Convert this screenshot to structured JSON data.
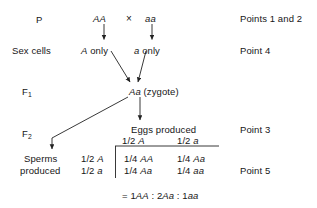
{
  "figure": {
    "type": "genetics-monohybrid-cross",
    "stroke_color": "#222222",
    "text_color": "#161616",
    "background": "#ffffff"
  },
  "rows": {
    "p": {
      "label": "P",
      "parent_left": "AA",
      "cross_symbol": "×",
      "parent_right": "aa",
      "point": "Points 1 and 2"
    },
    "sex_cells": {
      "label": "Sex cells",
      "gamete_left_allele": "A",
      "gamete_left_text": " only",
      "gamete_right_allele": "a",
      "gamete_right_text": " only",
      "point": "Point 4"
    },
    "f1": {
      "label": "F",
      "label_sub": "1",
      "zygote_allele": "Aa",
      "zygote_text": " (zygote)"
    },
    "f2": {
      "label": "F",
      "label_sub": "2",
      "point_eggs": "Point 3",
      "point_square": "Point 5"
    }
  },
  "punnett": {
    "eggs_header": "Eggs produced",
    "egg_columns": [
      {
        "fraction": "1/2 ",
        "allele": "A"
      },
      {
        "fraction": "1/2 ",
        "allele": "a"
      }
    ],
    "sperms_header_line1": "Sperms",
    "sperms_header_line2": "produced",
    "sperm_rows": [
      {
        "fraction": "1/2 ",
        "allele": "A"
      },
      {
        "fraction": "1/2 ",
        "allele": "a"
      }
    ],
    "cells": [
      [
        {
          "fraction": "1/4 ",
          "genotype": "AA"
        },
        {
          "fraction": "1/4 ",
          "genotype": "Aa"
        }
      ],
      [
        {
          "fraction": "1/4 ",
          "genotype": "Aa"
        },
        {
          "fraction": "1/4 ",
          "genotype": "aa"
        }
      ]
    ]
  },
  "ratio": {
    "equals": "= ",
    "term1_count": "1",
    "term1_genotype": "AA",
    "sep1": " : ",
    "term2_count": "2",
    "term2_genotype": "Aa",
    "sep2": " : ",
    "term3_count": "1",
    "term3_genotype": "aa"
  }
}
